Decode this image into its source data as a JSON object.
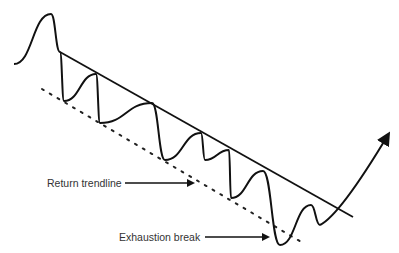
{
  "diagram": {
    "type": "price-channel-exhaustion-break",
    "colors": {
      "line": "#111111",
      "text": "#333333",
      "background": "#ffffff"
    },
    "price_path": [
      [
        14,
        64
      ],
      [
        51,
        14
      ],
      [
        60,
        52
      ],
      [
        64,
        101
      ],
      [
        96,
        74
      ],
      [
        100,
        123
      ],
      [
        152,
        103
      ],
      [
        165,
        160
      ],
      [
        201,
        133
      ],
      [
        205,
        160
      ],
      [
        229,
        150
      ],
      [
        231,
        198
      ],
      [
        263,
        171
      ],
      [
        280,
        245
      ],
      [
        311,
        205
      ],
      [
        320,
        225
      ],
      [
        388,
        135
      ]
    ],
    "main_trendline": {
      "style": "solid",
      "from": [
        60,
        52
      ],
      "to": [
        353,
        217
      ]
    },
    "return_trendline": {
      "style": "dotted",
      "from": [
        42,
        89
      ],
      "to": [
        303,
        243
      ]
    },
    "breakout_arrow_icon": "arrow-up-right"
  },
  "annotations": [
    {
      "text": "Return trendline",
      "x": 47,
      "y": 177,
      "arrow_from": [
        125,
        183
      ],
      "arrow_to": [
        193,
        183
      ]
    },
    {
      "text": "Exhaustion break",
      "x": 119,
      "y": 231,
      "arrow_from": [
        205,
        237
      ],
      "arrow_to": [
        268,
        237
      ]
    }
  ]
}
